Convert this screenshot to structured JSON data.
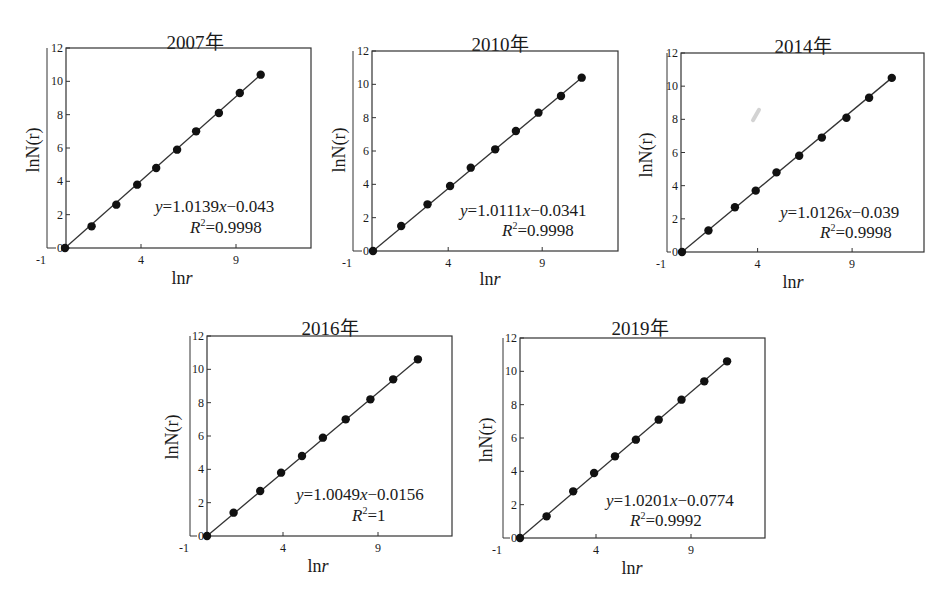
{
  "figure": {
    "panels": [
      {
        "title": "2007年",
        "xlabel_main": "ln",
        "xlabel_var": "r",
        "ylabel": "lnN(r)",
        "equation": {
          "y": "y",
          "eq1": "=1.0139",
          "x": "x",
          "eq2": "−0.043"
        },
        "r2": {
          "R": "R",
          "sup": "2",
          "val": "=0.9998"
        }
      },
      {
        "title": "2010年",
        "xlabel_main": "ln",
        "xlabel_var": "r",
        "ylabel": "lnN(r)",
        "equation": {
          "y": "y",
          "eq1": "=1.0111",
          "x": "x",
          "eq2": "−0.0341"
        },
        "r2": {
          "R": "R",
          "sup": "2",
          "val": "=0.9998"
        }
      },
      {
        "title": "2014年",
        "xlabel_main": "ln",
        "xlabel_var": "r",
        "ylabel": "lnN(r)",
        "equation": {
          "y": "y",
          "eq1": "=1.0126",
          "x": "x",
          "eq2": "−0.039"
        },
        "r2": {
          "R": "R",
          "sup": "2",
          "val": "=0.9998"
        }
      },
      {
        "title": "2016年",
        "xlabel_main": "ln",
        "xlabel_var": "r",
        "ylabel": "lnN(r)",
        "equation": {
          "y": "y",
          "eq1": "=1.0049",
          "x": "x",
          "eq2": "−0.0156"
        },
        "r2": {
          "R": "R",
          "sup": "2",
          "val": "=1"
        }
      },
      {
        "title": "2019年",
        "xlabel_main": "ln",
        "xlabel_var": "r",
        "ylabel": "lnN(r)",
        "equation": {
          "y": "y",
          "eq1": "=1.0201",
          "x": "x",
          "eq2": "−0.0774"
        },
        "r2": {
          "R": "R",
          "sup": "2",
          "val": "=0.9992"
        }
      }
    ],
    "x_ticks": [
      "-1",
      "4",
      "9"
    ],
    "y_ticks": [
      "0",
      "2",
      "4",
      "6",
      "8",
      "10",
      "12"
    ],
    "colors": {
      "ink": "#1a1a1a",
      "line": "#333333",
      "marker": "#111111",
      "background": "#ffffff"
    }
  },
  "chart_data": [
    {
      "type": "scatter",
      "title": "2007年",
      "xlabel": "lnr",
      "ylabel": "lnN(r)",
      "xlim": [
        -1,
        13
      ],
      "ylim": [
        0,
        12
      ],
      "x_ticks": [
        -1,
        4,
        9
      ],
      "y_ticks": [
        0,
        2,
        4,
        6,
        8,
        10,
        12
      ],
      "grid": false,
      "legend": null,
      "x": [
        0,
        1.4,
        2.7,
        3.8,
        4.8,
        5.9,
        6.9,
        8.1,
        9.2,
        10.3
      ],
      "y": [
        0,
        1.3,
        2.6,
        3.8,
        4.8,
        5.9,
        7.0,
        8.1,
        9.3,
        10.4
      ],
      "trendline": {
        "slope": 1.0139,
        "intercept": -0.043,
        "r2": 0.9998
      },
      "annotations": [
        "y=1.0139x−0.043",
        "R²=0.9998"
      ]
    },
    {
      "type": "scatter",
      "title": "2010年",
      "xlabel": "lnr",
      "ylabel": "lnN(r)",
      "xlim": [
        -1,
        13
      ],
      "ylim": [
        0,
        12
      ],
      "x_ticks": [
        -1,
        4,
        9
      ],
      "y_ticks": [
        0,
        2,
        4,
        6,
        8,
        10,
        12
      ],
      "grid": false,
      "legend": null,
      "x": [
        0,
        1.5,
        2.9,
        4.1,
        5.2,
        6.5,
        7.6,
        8.8,
        10.0,
        11.1
      ],
      "y": [
        0,
        1.5,
        2.8,
        3.9,
        5.0,
        6.1,
        7.2,
        8.3,
        9.3,
        10.4
      ],
      "trendline": {
        "slope": 1.0111,
        "intercept": -0.0341,
        "r2": 0.9998
      },
      "annotations": [
        "y=1.0111x−0.0341",
        "R²=0.9998"
      ]
    },
    {
      "type": "scatter",
      "title": "2014年",
      "xlabel": "lnr",
      "ylabel": "lnN(r)",
      "xlim": [
        -1,
        13
      ],
      "ylim": [
        0,
        12
      ],
      "x_ticks": [
        -1,
        4,
        9
      ],
      "y_ticks": [
        0,
        2,
        4,
        6,
        8,
        10,
        12
      ],
      "grid": false,
      "legend": null,
      "x": [
        0,
        1.4,
        2.8,
        3.9,
        5.0,
        6.2,
        7.4,
        8.7,
        9.9,
        11.1
      ],
      "y": [
        0,
        1.3,
        2.7,
        3.7,
        4.8,
        5.8,
        6.9,
        8.1,
        9.3,
        10.5
      ],
      "trendline": {
        "slope": 1.0126,
        "intercept": -0.039,
        "r2": 0.9998
      },
      "annotations": [
        "y=1.0126x−0.039",
        "R²=0.9998"
      ]
    },
    {
      "type": "scatter",
      "title": "2016年",
      "xlabel": "lnr",
      "ylabel": "lnN(r)",
      "xlim": [
        -1,
        13
      ],
      "ylim": [
        0,
        12
      ],
      "x_ticks": [
        -1,
        4,
        9
      ],
      "y_ticks": [
        0,
        2,
        4,
        6,
        8,
        10,
        12
      ],
      "grid": false,
      "legend": null,
      "x": [
        0,
        1.4,
        2.8,
        3.9,
        5.0,
        6.1,
        7.3,
        8.6,
        9.8,
        11.1
      ],
      "y": [
        0,
        1.4,
        2.7,
        3.8,
        4.8,
        5.9,
        7.0,
        8.2,
        9.4,
        10.6
      ],
      "trendline": {
        "slope": 1.0049,
        "intercept": -0.0156,
        "r2": 1
      },
      "annotations": [
        "y=1.0049x−0.0156",
        "R²=1"
      ]
    },
    {
      "type": "scatter",
      "title": "2019年",
      "xlabel": "lnr",
      "ylabel": "lnN(r)",
      "xlim": [
        -1,
        13
      ],
      "ylim": [
        0,
        12
      ],
      "x_ticks": [
        -1,
        4,
        9
      ],
      "y_ticks": [
        0,
        2,
        4,
        6,
        8,
        10,
        12
      ],
      "grid": false,
      "legend": null,
      "x": [
        0,
        1.4,
        2.8,
        3.9,
        5.0,
        6.1,
        7.3,
        8.5,
        9.7,
        10.9
      ],
      "y": [
        0,
        1.3,
        2.8,
        3.9,
        4.9,
        5.9,
        7.1,
        8.3,
        9.4,
        10.6
      ],
      "trendline": {
        "slope": 1.0201,
        "intercept": -0.0774,
        "r2": 0.9992
      },
      "annotations": [
        "y=1.0201x−0.0774",
        "R²=0.9992"
      ]
    }
  ]
}
